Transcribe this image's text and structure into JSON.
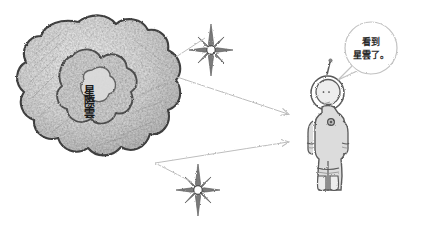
{
  "illustration": {
    "title": "Interstellar cloud observed by an astronaut",
    "medium": "pencil sketch",
    "background_color": "#ffffff"
  },
  "cloud": {
    "name": "interstellar-cloud",
    "label_chars": [
      "星",
      "際",
      "雲"
    ],
    "label_text": "星際雲",
    "outline_color": "#4a4a4a",
    "fill_color": "#d8d8d8"
  },
  "stars": [
    {
      "name": "sparkle-star-upper",
      "points": 8,
      "color": "#6a6a6a"
    },
    {
      "name": "sparkle-star-lower",
      "points": 8,
      "color": "#6a6a6a"
    }
  ],
  "arrows": [
    {
      "name": "arrow-upper",
      "from": "cloud",
      "to": "astronaut",
      "color": "#b9b9b9"
    },
    {
      "name": "arrow-lower",
      "from": "cloud",
      "to": "astronaut",
      "color": "#b9b9b9"
    }
  ],
  "astronaut": {
    "name": "astronaut-figure",
    "suit_color": "#dcdcdc",
    "outline_color": "#5a5a5a",
    "has_helmet": true,
    "has_antenna": true,
    "has_chest_unit": true
  },
  "speech_bubble": {
    "name": "speech-bubble",
    "lines": [
      "看到",
      "星雲了。"
    ],
    "full_text": "看到星雲了。",
    "outline_color": "#c2c2c2"
  }
}
